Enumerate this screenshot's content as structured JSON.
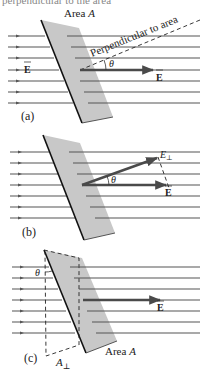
{
  "caption_fragment": "perpendicular to the area",
  "colors": {
    "plate": "#c8c8c8",
    "field_line": "#555555",
    "vector": "#4a4a4a",
    "edge": "#111111"
  },
  "panels": [
    {
      "id": "a",
      "label": "(a)",
      "area_label": "Area A",
      "area_prefix": "Area",
      "area_symbol": "A",
      "normal_label": "Perpendicular to area",
      "field_label_left": "E",
      "field_label_right": "E",
      "angle_label": "θ"
    },
    {
      "id": "b",
      "label": "(b)",
      "field_label": "E",
      "perp_component_label": "E",
      "perp_subscript": "⊥",
      "angle_label": "θ"
    },
    {
      "id": "c",
      "label": "(c)",
      "area_prefix": "Area",
      "area_symbol": "A",
      "projected_area_symbol": "A",
      "projected_area_subscript": "⊥",
      "field_label": "E",
      "angle_label": "θ"
    }
  ]
}
